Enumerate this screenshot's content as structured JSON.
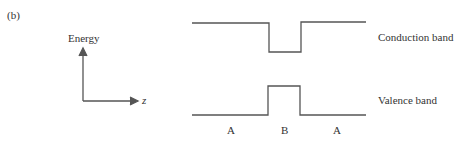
{
  "figure": {
    "panel_label": "(b)",
    "axes": {
      "y_label": "Energy",
      "x_label": "z"
    },
    "band_labels": {
      "conduction": "Conduction band",
      "valence": "Valence band"
    },
    "region_labels": [
      "A",
      "B",
      "A"
    ],
    "line_color": "#555555"
  }
}
